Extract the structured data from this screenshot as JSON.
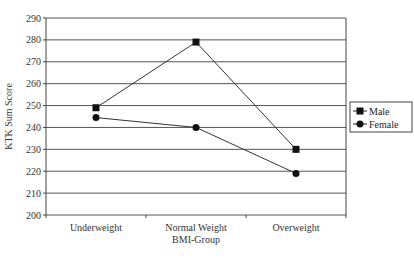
{
  "chart_data": {
    "type": "line",
    "title": "",
    "xlabel": "BMI-Group",
    "ylabel": "KTK Sum Score",
    "categories": [
      "Underweight",
      "Normal Weight",
      "Overweight"
    ],
    "ylim": [
      200,
      290
    ],
    "yticks": [
      200,
      210,
      220,
      230,
      240,
      250,
      260,
      270,
      280,
      290
    ],
    "grid": true,
    "legend_position": "right",
    "series": [
      {
        "name": "Male",
        "marker": "square",
        "values": [
          249,
          279,
          230
        ]
      },
      {
        "name": "Female",
        "marker": "circle",
        "values": [
          244.5,
          240,
          219
        ]
      }
    ]
  }
}
